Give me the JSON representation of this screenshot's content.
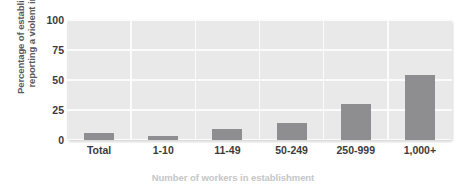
{
  "chart_data": {
    "type": "bar",
    "title": "",
    "subtitle": "",
    "xlabel": "Number of workers in establishment",
    "ylabel": "Percentage of establishments reporting a violent incident",
    "ylabel_line1": "Percentage of establishments",
    "ylabel_line2": "reporting a violent incident",
    "categories": [
      "Total",
      "1-10",
      "11-49",
      "50-249",
      "250-999",
      "1,000+"
    ],
    "values": [
      6,
      3,
      9,
      14,
      30,
      54
    ],
    "series": [
      {
        "name": "Percentage of establishments reporting a violent incident",
        "values": [
          6,
          3,
          9,
          14,
          30,
          54
        ]
      }
    ],
    "ylim": [
      0,
      100
    ],
    "yticks": [
      0,
      25,
      50,
      75,
      100
    ],
    "ytick_labels": [
      "0",
      "25",
      "50",
      "75",
      "100"
    ],
    "grid": "horizontal-and-vertical",
    "legend": "none",
    "bar_color": "#8e8e90",
    "plot_background": "#e9e9e9",
    "grid_color": "#fbfbfb",
    "tick_label_color": "#3b3b3d",
    "axis_label_color": "#58585a",
    "xlabel_color": "#c6c6c6"
  }
}
